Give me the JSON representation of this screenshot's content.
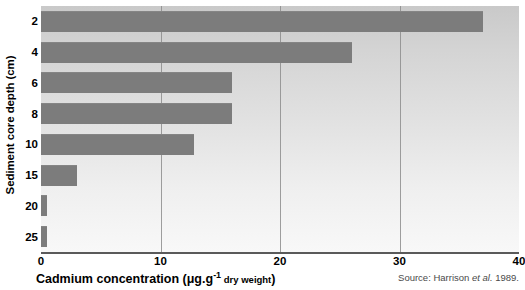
{
  "chart_data": {
    "type": "bar",
    "orientation": "horizontal",
    "title": "",
    "xlabel": "Cadmium concentration (μg.g⁻¹ dry weight)",
    "ylabel": "Sediment core depth (cm)",
    "categories": [
      "2",
      "4",
      "6",
      "8",
      "10",
      "15",
      "20",
      "25"
    ],
    "values": [
      37,
      26,
      16,
      16,
      12.8,
      3,
      0.5,
      0.5
    ],
    "xlim": [
      0,
      40
    ],
    "xticks": [
      0,
      10,
      20,
      30,
      40
    ],
    "xticklabels": [
      "0",
      "10",
      "20",
      "30",
      "40"
    ],
    "yticklabels": [
      "2",
      "4",
      "6",
      "8",
      "10",
      "15",
      "20",
      "25"
    ],
    "grid": "vertical",
    "legend": "none",
    "bar_color": "#7c7c7c",
    "plot_background": "#d8d8d8",
    "gridline_color": "#8d8d8d",
    "axis_color": "#5a5a5a"
  },
  "axes": {
    "y_title": "Sediment core depth (cm)",
    "x_title_main": "Cadmium concentration (",
    "x_title_mu": "μg.g",
    "x_title_sup": "-1",
    "x_title_small": " dry weight",
    "x_title_end": ")"
  },
  "source": {
    "prefix": "Source: Harrison ",
    "italic": "et al.",
    "suffix": " 1989."
  }
}
